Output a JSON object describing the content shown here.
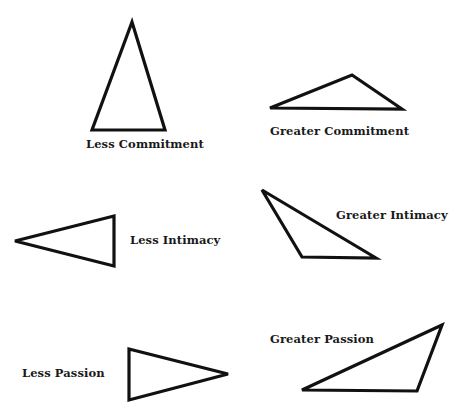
{
  "diagram": {
    "panels": [
      {
        "id": "less-commitment",
        "label": "Less Commitment",
        "triangle": [
          [
            132,
            22
          ],
          [
            92,
            130
          ],
          [
            165,
            130
          ]
        ]
      },
      {
        "id": "greater-commitment",
        "label": "Greater Commitment",
        "triangle": [
          [
            270,
            108
          ],
          [
            352,
            75
          ],
          [
            402,
            109
          ]
        ]
      },
      {
        "id": "less-intimacy",
        "label": "Less Intimacy",
        "triangle": [
          [
            15,
            241
          ],
          [
            114,
            216
          ],
          [
            114,
            266
          ]
        ]
      },
      {
        "id": "greater-intimacy",
        "label": "Greater Intimacy",
        "triangle": [
          [
            262,
            190
          ],
          [
            302,
            257
          ],
          [
            376,
            258
          ]
        ]
      },
      {
        "id": "less-passion",
        "label": "Less Passion",
        "triangle": [
          [
            129,
            349
          ],
          [
            228,
            374
          ],
          [
            129,
            400
          ]
        ]
      },
      {
        "id": "greater-passion",
        "label": "Greater Passion",
        "triangle": [
          [
            442,
            325
          ],
          [
            302,
            390
          ],
          [
            417,
            391
          ]
        ]
      }
    ],
    "stroke_color": "#111111",
    "background": "#ffffff"
  }
}
